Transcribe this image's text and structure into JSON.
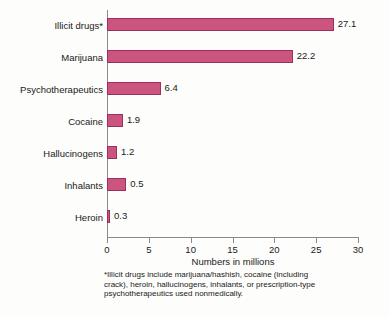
{
  "chart_data": {
    "type": "bar",
    "orientation": "horizontal",
    "title": "",
    "xlabel": "Numbers in millions",
    "ylabel": "",
    "xlim": [
      0,
      30
    ],
    "xticks": [
      0,
      5,
      10,
      15,
      20,
      25,
      30
    ],
    "grid": false,
    "legend": null,
    "categories": [
      "Illicit drugs*",
      "Marijuana",
      "Psychotherapeutics",
      "Cocaine",
      "Hallucinogens",
      "Inhalants",
      "Heroin"
    ],
    "values": [
      27.1,
      22.2,
      6.4,
      1.9,
      1.2,
      0.5,
      0.3
    ],
    "value_labels": [
      "27.1",
      "22.2",
      "6.4",
      "1.9",
      "1.2",
      "0.5",
      "0.3"
    ],
    "drawn_lengths": [
      27.1,
      22.2,
      6.4,
      1.9,
      1.2,
      2.3,
      0.3
    ],
    "bar_color": "#cc5580",
    "bar_border_color": "#9e2f5c",
    "axis_color": "#8a8a8a",
    "background_color": "#fdfdfb",
    "annotations": [
      "*Illicit drugs include marijuana/hashish, cocaine (including",
      "crack), heroin, hallucinogens, inhalants, or prescription-type",
      "psychotherapeutics used nonmedically."
    ]
  }
}
